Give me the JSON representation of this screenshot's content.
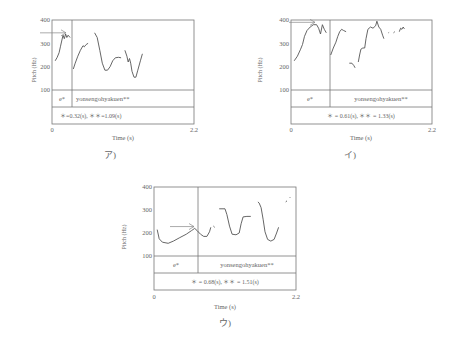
{
  "figure": {
    "panels": [
      {
        "id": "a",
        "caption": "ア)",
        "ylabel": "Pitch (Hz)",
        "xlabel": "Time (s)",
        "yticks": [
          "400",
          "300",
          "200",
          "100"
        ],
        "xtick_start": "0",
        "xtick_end": "2.2",
        "segment_label_1": "e*",
        "segment_label_2": "yonsengohyakuen**",
        "duration_text": "＊=0.32(s), ＊＊=1.09(s)"
      },
      {
        "id": "i",
        "caption": "イ)",
        "ylabel": "Pitch (Hz)",
        "xlabel": "Time (s)",
        "yticks": [
          "400",
          "300",
          "200",
          "100"
        ],
        "xtick_start": "0",
        "xtick_end": "2.2",
        "segment_label_1": "e*",
        "segment_label_2": "yonsengohyakuen**",
        "duration_text": "＊ = 0.61(s), ＊＊ = 1.33(s)"
      },
      {
        "id": "u",
        "caption": "ウ)",
        "ylabel": "Pitch (Hz)",
        "xlabel": "Time (s)",
        "yticks": [
          "400",
          "300",
          "200",
          "100"
        ],
        "xtick_start": "0",
        "xtick_end": "2.2",
        "segment_label_1": "e*",
        "segment_label_2": "yonsengohyakuen**",
        "duration_text": "＊ = 0.68(s), ＊＊ = 1.51(s)"
      }
    ]
  },
  "chart_data": [
    {
      "type": "line",
      "title": "ア)",
      "xlabel": "Time (s)",
      "ylabel": "Pitch (Hz)",
      "xlim": [
        0,
        2.2
      ],
      "ylim": [
        100,
        400
      ],
      "yticks": [
        100,
        200,
        300,
        400
      ],
      "segments": [
        {
          "label": "e*",
          "duration_s": 0.32
        },
        {
          "label": "yonsengohyakuen**",
          "duration_s": 1.09
        }
      ],
      "boundary_s": 0.32,
      "arrow_at_hz": 345,
      "series": [
        {
          "name": "pitch-1",
          "points": [
            [
              0.05,
              225
            ],
            [
              0.08,
              240
            ],
            [
              0.11,
              260
            ],
            [
              0.13,
              285
            ],
            [
              0.15,
              310
            ],
            [
              0.17,
              335
            ],
            [
              0.19,
              320
            ],
            [
              0.21,
              340
            ],
            [
              0.23,
              325
            ],
            [
              0.25,
              335
            ],
            [
              0.28,
              325
            ]
          ]
        },
        {
          "name": "pitch-2",
          "points": [
            [
              0.33,
              190
            ],
            [
              0.36,
              215
            ],
            [
              0.4,
              245
            ],
            [
              0.44,
              270
            ],
            [
              0.48,
              290
            ],
            [
              0.5,
              285
            ],
            [
              0.53,
              295
            ],
            [
              0.56,
              300
            ]
          ]
        },
        {
          "name": "pitch-3",
          "points": [
            [
              0.66,
              345
            ],
            [
              0.7,
              325
            ],
            [
              0.74,
              270
            ],
            [
              0.78,
              215
            ],
            [
              0.82,
              185
            ],
            [
              0.86,
              185
            ],
            [
              0.9,
              200
            ],
            [
              0.94,
              225
            ],
            [
              0.98,
              238
            ],
            [
              1.03,
              240
            ],
            [
              1.07,
              238
            ]
          ]
        },
        {
          "name": "pitch-4",
          "points": [
            [
              1.13,
              270
            ],
            [
              1.16,
              245
            ],
            [
              1.18,
              220
            ],
            [
              1.2,
              235
            ],
            [
              1.22,
              215
            ],
            [
              1.24,
              180
            ],
            [
              1.27,
              155
            ],
            [
              1.3,
              155
            ],
            [
              1.33,
              185
            ],
            [
              1.37,
              225
            ],
            [
              1.4,
              255
            ]
          ]
        }
      ]
    },
    {
      "type": "line",
      "title": "イ)",
      "xlabel": "Time (s)",
      "ylabel": "Pitch (Hz)",
      "xlim": [
        0,
        2.2
      ],
      "ylim": [
        100,
        400
      ],
      "yticks": [
        100,
        200,
        300,
        400
      ],
      "segments": [
        {
          "label": "e*",
          "duration_s": 0.61
        },
        {
          "label": "yonsengohyakuen**",
          "duration_s": 1.33
        }
      ],
      "boundary_s": 0.61,
      "arrow_at_hz": 390,
      "series": [
        {
          "name": "pitch-1",
          "points": [
            [
              0.05,
              225
            ],
            [
              0.1,
              245
            ],
            [
              0.15,
              275
            ],
            [
              0.18,
              295
            ],
            [
              0.21,
              330
            ],
            [
              0.25,
              355
            ],
            [
              0.3,
              370
            ],
            [
              0.35,
              380
            ],
            [
              0.4,
              380
            ],
            [
              0.43,
              365
            ],
            [
              0.46,
              340
            ],
            [
              0.49,
              380
            ],
            [
              0.52,
              360
            ],
            [
              0.55,
              345
            ]
          ]
        },
        {
          "name": "pitch-2",
          "points": [
            [
              0.62,
              250
            ],
            [
              0.66,
              280
            ],
            [
              0.7,
              305
            ],
            [
              0.73,
              330
            ],
            [
              0.76,
              350
            ],
            [
              0.79,
              360
            ],
            [
              0.82,
              355
            ],
            [
              0.86,
              350
            ]
          ]
        },
        {
          "name": "pitch-3",
          "points": [
            [
              0.91,
              215
            ],
            [
              0.95,
              215
            ],
            [
              0.98,
              205
            ],
            [
              1.0,
              195
            ]
          ]
        },
        {
          "name": "pitch-4",
          "points": [
            [
              1.05,
              220
            ],
            [
              1.07,
              250
            ],
            [
              1.09,
              275
            ],
            [
              1.12,
              280
            ],
            [
              1.15,
              280
            ],
            [
              1.17,
              320
            ],
            [
              1.2,
              360
            ],
            [
              1.24,
              370
            ],
            [
              1.28,
              365
            ],
            [
              1.32,
              375
            ],
            [
              1.34,
              395
            ],
            [
              1.37,
              370
            ],
            [
              1.4,
              360
            ],
            [
              1.43,
              335
            ],
            [
              1.45,
              320
            ]
          ]
        },
        {
          "name": "pitch-5",
          "points": [
            [
              1.52,
              345
            ],
            [
              1.53,
              347
            ]
          ]
        },
        {
          "name": "pitch-6",
          "points": [
            [
              1.6,
              345
            ],
            [
              1.62,
              350
            ]
          ]
        },
        {
          "name": "pitch-7",
          "points": [
            [
              1.69,
              350
            ],
            [
              1.71,
              365
            ],
            [
              1.73,
              360
            ],
            [
              1.75,
              370
            ],
            [
              1.77,
              362
            ]
          ]
        }
      ]
    },
    {
      "type": "line",
      "title": "ウ)",
      "xlabel": "Time (s)",
      "ylabel": "Pitch (Hz)",
      "xlim": [
        0,
        2.2
      ],
      "ylim": [
        100,
        400
      ],
      "yticks": [
        100,
        200,
        300,
        400
      ],
      "segments": [
        {
          "label": "e*",
          "duration_s": 0.68
        },
        {
          "label": "yonsengohyakuen**",
          "duration_s": 1.51
        }
      ],
      "boundary_s": 0.68,
      "arrow_at_hz": 228,
      "series": [
        {
          "name": "pitch-1",
          "points": [
            [
              0.05,
              215
            ],
            [
              0.08,
              175
            ],
            [
              0.13,
              160
            ],
            [
              0.22,
              155
            ],
            [
              0.3,
              165
            ],
            [
              0.4,
              180
            ],
            [
              0.5,
              195
            ],
            [
              0.58,
              210
            ],
            [
              0.63,
              220
            ],
            [
              0.67,
              210
            ],
            [
              0.72,
              195
            ],
            [
              0.77,
              185
            ],
            [
              0.82,
              185
            ],
            [
              0.86,
              205
            ],
            [
              0.88,
              225
            ]
          ]
        },
        {
          "name": "pitch-2",
          "points": [
            [
              0.92,
              230
            ],
            [
              0.94,
              225
            ]
          ]
        },
        {
          "name": "pitch-3",
          "points": [
            [
              1.01,
              305
            ],
            [
              1.1,
              305
            ],
            [
              1.13,
              280
            ],
            [
              1.17,
              230
            ],
            [
              1.21,
              195
            ],
            [
              1.27,
              192
            ],
            [
              1.32,
              200
            ],
            [
              1.35,
              240
            ],
            [
              1.38,
              270
            ],
            [
              1.44,
              272
            ],
            [
              1.5,
              272
            ]
          ]
        },
        {
          "name": "pitch-4",
          "points": [
            [
              1.61,
              335
            ],
            [
              1.63,
              330
            ],
            [
              1.66,
              310
            ],
            [
              1.69,
              260
            ],
            [
              1.72,
              205
            ],
            [
              1.76,
              172
            ],
            [
              1.81,
              165
            ],
            [
              1.86,
              172
            ],
            [
              1.9,
              200
            ],
            [
              1.93,
              225
            ]
          ]
        },
        {
          "name": "pitch-5",
          "points": [
            [
              2.04,
              335
            ],
            [
              2.06,
              340
            ]
          ]
        },
        {
          "name": "pitch-6",
          "points": [
            [
              2.1,
              352
            ],
            [
              2.11,
              355
            ]
          ]
        }
      ]
    }
  ]
}
